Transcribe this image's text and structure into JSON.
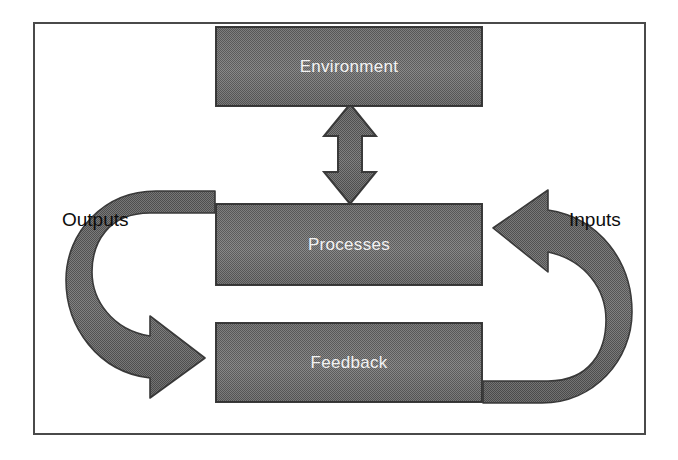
{
  "diagram": {
    "frame": {
      "border_color": "#4a4a4a"
    },
    "palette": {
      "box_fill": "#787878",
      "box_border": "#3b3b3b",
      "arrow_fill": "#6e6e6e",
      "arrow_border": "#3b3b3b",
      "node_text": "#ffffff",
      "label_text": "#0d0d0d",
      "background": "#ffffff"
    },
    "nodes": [
      {
        "id": "environment",
        "label": "Environment"
      },
      {
        "id": "processes",
        "label": "Processes"
      },
      {
        "id": "feedback",
        "label": "Feedback"
      }
    ],
    "labels": [
      {
        "id": "outputs",
        "label": "Outputs"
      },
      {
        "id": "inputs",
        "label": "Inputs"
      }
    ],
    "connectors": [
      {
        "id": "environment-processes",
        "kind": "double-headed-vertical-arrow",
        "from": "environment",
        "to": "processes",
        "bidirectional": true
      },
      {
        "id": "processes-feedback-outputs",
        "kind": "curved-arrow-left",
        "from": "processes",
        "to": "feedback",
        "label": "Outputs",
        "bidirectional": false
      },
      {
        "id": "feedback-processes-inputs",
        "kind": "curved-arrow-right",
        "from": "feedback",
        "to": "processes",
        "label": "Inputs",
        "bidirectional": false
      }
    ]
  }
}
